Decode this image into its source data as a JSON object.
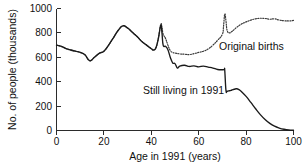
{
  "chart_data": {
    "type": "line",
    "title": "",
    "xlabel": "Age in 1991 (years)",
    "ylabel": "No. of people (thousands)",
    "xlim": [
      0,
      100
    ],
    "ylim": [
      0,
      1000
    ],
    "xticks": [
      0,
      20,
      40,
      60,
      80,
      100
    ],
    "yticks": [
      0,
      200,
      400,
      600,
      800,
      1000
    ],
    "xtick_labels": [
      "0",
      "20",
      "40",
      "60",
      "80",
      "100"
    ],
    "ytick_labels": [
      "0",
      "200",
      "400",
      "600",
      "800",
      "1000"
    ],
    "grid": false,
    "legend_position": "inline-annotation",
    "series": [
      {
        "name": "Original births",
        "style": "dotted",
        "annotation": "Original births",
        "x": [
          0,
          2,
          4,
          6,
          8,
          10,
          12,
          14,
          16,
          18,
          20,
          22,
          24,
          26,
          28,
          30,
          32,
          34,
          36,
          38,
          40,
          41,
          42,
          43,
          44,
          44.5,
          45,
          46,
          47,
          48,
          49,
          50,
          52,
          54,
          56,
          58,
          60,
          62,
          64,
          66,
          68,
          70,
          70.5,
          71,
          71.5,
          72,
          73,
          74,
          75,
          76,
          78,
          80,
          82,
          84,
          86,
          88,
          90,
          92,
          94,
          96,
          98,
          100
        ],
        "y": [
          700,
          690,
          672,
          660,
          650,
          640,
          620,
          572,
          600,
          632,
          650,
          700,
          760,
          820,
          858,
          840,
          805,
          770,
          730,
          700,
          672,
          660,
          680,
          760,
          870,
          845,
          790,
          755,
          700,
          655,
          640,
          635,
          628,
          625,
          622,
          630,
          640,
          650,
          668,
          700,
          740,
          790,
          860,
          955,
          900,
          820,
          800,
          812,
          828,
          845,
          872,
          890,
          905,
          915,
          920,
          918,
          912,
          915,
          905,
          900,
          898,
          902
        ]
      },
      {
        "name": "Still living in 1991",
        "style": "solid",
        "annotation": "Still living in 1991",
        "x": [
          0,
          2,
          4,
          6,
          8,
          10,
          12,
          14,
          16,
          18,
          20,
          22,
          24,
          26,
          28,
          30,
          32,
          34,
          36,
          38,
          40,
          41,
          42,
          43,
          44,
          44.5,
          45,
          46,
          47,
          48,
          49,
          50,
          51,
          52,
          54,
          56,
          58,
          60,
          62,
          64,
          66,
          68,
          70,
          70.8,
          71,
          71.5,
          72,
          73,
          74,
          75,
          76,
          77,
          78,
          80,
          82,
          84,
          86,
          88,
          90,
          92,
          94,
          96,
          98,
          100
        ],
        "y": [
          700,
          690,
          672,
          660,
          650,
          640,
          620,
          572,
          600,
          632,
          650,
          700,
          760,
          820,
          858,
          840,
          805,
          770,
          730,
          700,
          670,
          660,
          680,
          755,
          862,
          800,
          700,
          690,
          662,
          600,
          555,
          548,
          512,
          528,
          535,
          525,
          530,
          522,
          528,
          520,
          512,
          500,
          498,
          500,
          492,
          330,
          322,
          326,
          332,
          338,
          342,
          335,
          320,
          280,
          230,
          178,
          130,
          90,
          58,
          35,
          20,
          10,
          4,
          2
        ]
      }
    ]
  },
  "axis": {
    "x_title": "Age in 1991 (years)",
    "y_title": "No. of people (thousands)"
  },
  "annotations": {
    "original_births": "Original births",
    "still_living": "Still living in 1991"
  },
  "colors": {
    "axis": "#2b2b2b",
    "solid_series": "#1a1a1a",
    "dotted_series": "#3a3a3a",
    "background": "#ffffff"
  }
}
